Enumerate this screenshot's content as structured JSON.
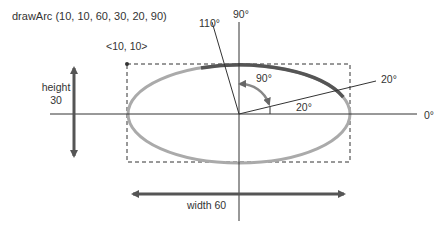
{
  "title": "drawArc (10, 10, 60, 30, 20, 90)",
  "labels": {
    "origin": "<10, 10>",
    "height_word": "height",
    "height_value": "30",
    "width": "width 60",
    "deg_90_axis": "90°",
    "deg_110": "110°",
    "deg_0": "0°",
    "deg_20_line": "20°",
    "deg_20_angle": "20°",
    "deg_90_sweep": "90°"
  },
  "arc_params": {
    "x": 10,
    "y": 10,
    "width": 60,
    "height": 30,
    "start_angle": 20,
    "arc_angle": 90,
    "end_angle": 110
  },
  "colors": {
    "ellipse": "#aaaaaa",
    "arc": "#555555",
    "axis": "#333333",
    "dashed_rect": "#333333",
    "arrow": "#555555",
    "sweep_arrow": "#888888",
    "text": "#333333"
  }
}
